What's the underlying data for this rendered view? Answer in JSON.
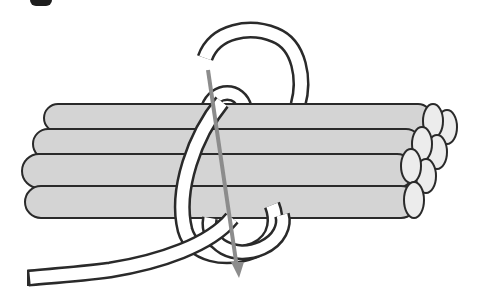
{
  "figure": {
    "title": "Knot tying step illustration",
    "step_badge": {
      "color": "#1e1e1e",
      "label": ""
    },
    "colors": {
      "background": "#ffffff",
      "rod_fill": "#d4d4d4",
      "rod_end_fill": "#ececec",
      "outline": "#2a2a2a",
      "rope_fill": "#ffffff",
      "arrow": "#8c8c8c"
    },
    "elements": {
      "rods": {
        "count": 7,
        "description": "bundle of cylindrical rods viewed from the side"
      },
      "rope": {
        "description": "white rope looping over and around the bundle"
      },
      "arrow": {
        "description": "gray arrow showing the rope working end direction (downward)"
      }
    }
  }
}
